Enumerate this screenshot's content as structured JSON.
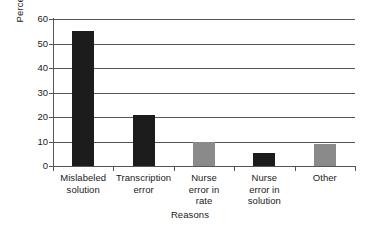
{
  "chart_data": {
    "type": "bar",
    "title": "",
    "xlabel": "Reasons",
    "ylabel": "Percent frequency",
    "categories": [
      "Mislabeled solution",
      "Transcription error",
      "Nurse error in rate",
      "Nurse error in solution",
      "Other"
    ],
    "category_lines": [
      [
        "Mislabeled",
        "solution"
      ],
      [
        "Transcription",
        "error"
      ],
      [
        "Nurse",
        "error in",
        "rate"
      ],
      [
        "Nurse",
        "error in",
        "solution"
      ],
      [
        "Other"
      ]
    ],
    "values": [
      55,
      21,
      10,
      5.5,
      9
    ],
    "bar_colors": [
      "#1c1c1c",
      "#1c1c1c",
      "#8a8a8a",
      "#1c1c1c",
      "#8a8a8a"
    ],
    "ylim": [
      0,
      60
    ],
    "yticks": [
      0,
      10,
      20,
      30,
      40,
      50,
      60
    ],
    "ytick_labels": [
      "0",
      "10",
      "20",
      "30",
      "40",
      "50",
      "60"
    ],
    "grid": true,
    "grid_axis": "y",
    "legend": "none",
    "gridline_color": "#555555",
    "axis_color": "#555555",
    "background": "#ffffff",
    "text_color": "#1a1a1a"
  }
}
